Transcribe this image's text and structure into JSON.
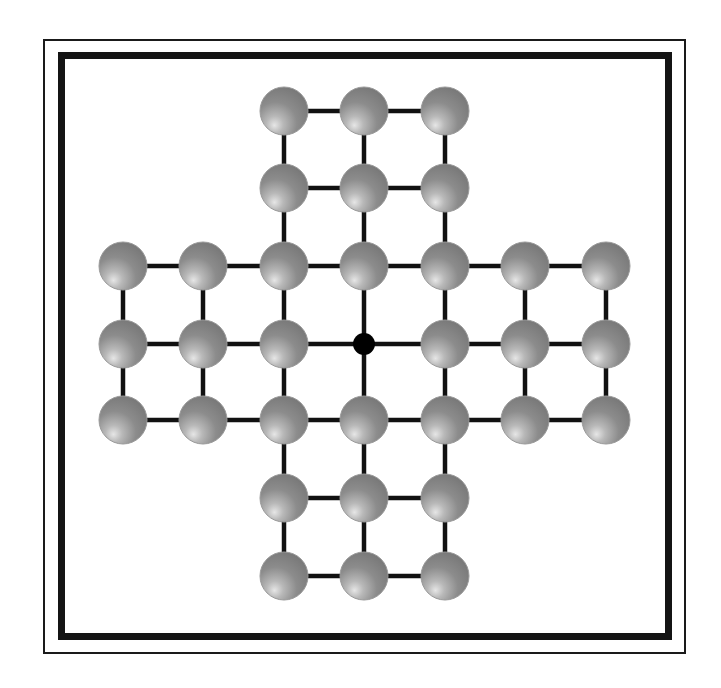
{
  "game": {
    "name": "Peg Solitaire",
    "board_type": "english-cross-33",
    "colors": {
      "peg_base": "#8a8a8a",
      "peg_dark": "#6e6e6e",
      "peg_highlight": "#dcdcdc",
      "line": "#111111",
      "hole": "#000000",
      "frame": "#141414",
      "background": "#ffffff"
    },
    "columns_x": [
      123,
      203,
      284,
      364,
      445,
      525,
      606
    ],
    "rows_y": [
      111,
      188,
      266,
      344,
      420,
      498,
      576
    ],
    "peg_radius": 24,
    "hole_radius": 11,
    "cells": [
      {
        "row": 0,
        "col": 2,
        "state": "peg"
      },
      {
        "row": 0,
        "col": 3,
        "state": "peg"
      },
      {
        "row": 0,
        "col": 4,
        "state": "peg"
      },
      {
        "row": 1,
        "col": 2,
        "state": "peg"
      },
      {
        "row": 1,
        "col": 3,
        "state": "peg"
      },
      {
        "row": 1,
        "col": 4,
        "state": "peg"
      },
      {
        "row": 2,
        "col": 0,
        "state": "peg"
      },
      {
        "row": 2,
        "col": 1,
        "state": "peg"
      },
      {
        "row": 2,
        "col": 2,
        "state": "peg"
      },
      {
        "row": 2,
        "col": 3,
        "state": "peg"
      },
      {
        "row": 2,
        "col": 4,
        "state": "peg"
      },
      {
        "row": 2,
        "col": 5,
        "state": "peg"
      },
      {
        "row": 2,
        "col": 6,
        "state": "peg"
      },
      {
        "row": 3,
        "col": 0,
        "state": "peg"
      },
      {
        "row": 3,
        "col": 1,
        "state": "peg"
      },
      {
        "row": 3,
        "col": 2,
        "state": "peg"
      },
      {
        "row": 3,
        "col": 3,
        "state": "empty"
      },
      {
        "row": 3,
        "col": 4,
        "state": "peg"
      },
      {
        "row": 3,
        "col": 5,
        "state": "peg"
      },
      {
        "row": 3,
        "col": 6,
        "state": "peg"
      },
      {
        "row": 4,
        "col": 0,
        "state": "peg"
      },
      {
        "row": 4,
        "col": 1,
        "state": "peg"
      },
      {
        "row": 4,
        "col": 2,
        "state": "peg"
      },
      {
        "row": 4,
        "col": 3,
        "state": "peg"
      },
      {
        "row": 4,
        "col": 4,
        "state": "peg"
      },
      {
        "row": 4,
        "col": 5,
        "state": "peg"
      },
      {
        "row": 4,
        "col": 6,
        "state": "peg"
      },
      {
        "row": 5,
        "col": 2,
        "state": "peg"
      },
      {
        "row": 5,
        "col": 3,
        "state": "peg"
      },
      {
        "row": 5,
        "col": 4,
        "state": "peg"
      },
      {
        "row": 6,
        "col": 2,
        "state": "peg"
      },
      {
        "row": 6,
        "col": 3,
        "state": "peg"
      },
      {
        "row": 6,
        "col": 4,
        "state": "peg"
      }
    ],
    "peg_count": 32,
    "empty_count": 1
  }
}
